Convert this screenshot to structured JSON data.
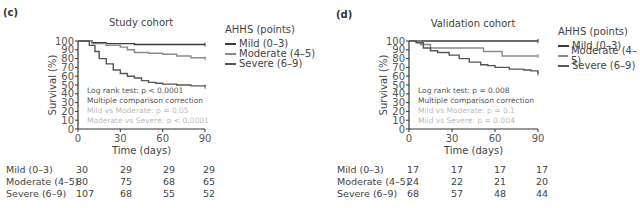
{
  "chart_data": [
    {
      "panel": "(c)",
      "type": "line",
      "subtype": "kaplan-meier-step",
      "title": "Study cohort",
      "xlabel": "Time (days)",
      "ylabel": "Survival (%)",
      "xlim": [
        0,
        90
      ],
      "ylim": [
        0,
        100
      ],
      "xticks": [
        0,
        30,
        60,
        90
      ],
      "yticks": [
        0,
        10,
        20,
        30,
        40,
        50,
        60,
        70,
        80,
        90,
        100
      ],
      "grid": false,
      "legend_title": "AHHS (points)",
      "legend_position": "right",
      "series": [
        {
          "name": "Mild (0–3)",
          "color": "#3a3a3a",
          "x": [
            0,
            5,
            10,
            20,
            40,
            60,
            90
          ],
          "y": [
            100,
            100,
            98,
            97,
            96,
            96,
            96
          ]
        },
        {
          "name": "Moderate (4–5)",
          "color": "#8a8a8a",
          "x": [
            0,
            5,
            10,
            20,
            30,
            35,
            40,
            50,
            60,
            70,
            80,
            90
          ],
          "y": [
            100,
            100,
            97,
            95,
            93,
            90,
            87,
            86,
            85,
            83,
            81,
            80
          ]
        },
        {
          "name": "Severe (6–9)",
          "color": "#555555",
          "x": [
            0,
            5,
            8,
            12,
            15,
            20,
            25,
            30,
            35,
            40,
            45,
            50,
            55,
            60,
            70,
            80,
            90
          ],
          "y": [
            100,
            100,
            95,
            88,
            80,
            74,
            67,
            63,
            60,
            58,
            55,
            53,
            52,
            51,
            50,
            49,
            48
          ]
        }
      ],
      "annotations": [
        "Log rank test: p < 0.0001",
        "Multiple comparison correction",
        "[illegible]",
        "[illegible] p < 0.0001"
      ],
      "risk_table": {
        "times": [
          0,
          30,
          60,
          90
        ],
        "rows": [
          {
            "label": "Mild (0–3)",
            "values": [
              30,
              29,
              29,
              29
            ]
          },
          {
            "label": "Moderate (4–5)",
            "values": [
              80,
              75,
              68,
              65
            ]
          },
          {
            "label": "Severe (6–9)",
            "values": [
              107,
              68,
              55,
              52
            ]
          }
        ]
      }
    },
    {
      "panel": "(d)",
      "type": "line",
      "subtype": "kaplan-meier-step",
      "title": "Validation cohort",
      "xlabel": "Time (days)",
      "ylabel": "Survival (%)",
      "xlim": [
        0,
        90
      ],
      "ylim": [
        0,
        100
      ],
      "xticks": [
        0,
        30,
        60,
        90
      ],
      "yticks": [
        0,
        10,
        20,
        30,
        40,
        50,
        60,
        70,
        80,
        90,
        100
      ],
      "grid": false,
      "legend_title": "AHHS (points)",
      "legend_position": "right",
      "series": [
        {
          "name": "Mild (0–3)",
          "color": "#3a3a3a",
          "x": [
            0,
            90
          ],
          "y": [
            100,
            100
          ]
        },
        {
          "name": "Moderate (4–5)",
          "color": "#8a8a8a",
          "x": [
            0,
            8,
            15,
            52,
            65,
            90
          ],
          "y": [
            100,
            96,
            92,
            88,
            83,
            83
          ]
        },
        {
          "name": "Severe (6–9)",
          "color": "#555555",
          "x": [
            0,
            5,
            10,
            15,
            20,
            28,
            35,
            42,
            50,
            55,
            60,
            70,
            80,
            85,
            90
          ],
          "y": [
            100,
            98,
            92,
            89,
            87,
            84,
            80,
            76,
            73,
            72,
            70,
            68,
            67,
            66,
            63
          ]
        }
      ],
      "annotations": [
        "Log rank test: p = 0.008",
        "Multiple comparison correction",
        "[illegible]",
        "[illegible]"
      ],
      "risk_table": {
        "times": [
          0,
          30,
          60,
          90
        ],
        "rows": [
          {
            "label": "Mild (0–3)",
            "values": [
              17,
              17,
              17,
              17
            ]
          },
          {
            "label": "Moderate (4–5)",
            "values": [
              24,
              22,
              21,
              20
            ]
          },
          {
            "label": "Severe (6–9)",
            "values": [
              68,
              57,
              48,
              44
            ]
          }
        ]
      }
    }
  ],
  "panels": [
    {
      "label": "(c)",
      "title": "Study cohort",
      "xlabel": "Time (days)",
      "ylabel": "Survival (%)",
      "legend": {
        "title": "AHHS (points)",
        "items": [
          "Mild (0–3)",
          "Moderate (4–5)",
          "Severe (6–9)"
        ]
      },
      "annot": [
        "Log rank test: p < 0.0001",
        "Multiple comparison correction",
        "Mild vs Moderate: p = 0.05",
        "Moderate vs Severe: p < 0.0001"
      ]
    },
    {
      "label": "(d)",
      "title": "Validation cohort",
      "xlabel": "Time (days)",
      "ylabel": "Survival (%)",
      "legend": {
        "title": "AHHS (points)",
        "items": [
          "Mild (0–3)",
          "Moderate (4–5)",
          "Severe (6–9)"
        ]
      },
      "annot": [
        "Log rank test: p = 0.008",
        "Multiple comparison correction",
        "Mild vs Moderate: p = 0.1",
        "Mild vs Severe: p = 0.004"
      ]
    }
  ]
}
